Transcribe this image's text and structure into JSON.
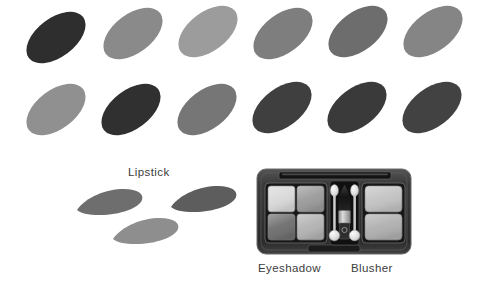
{
  "figure": {
    "background_color": "#ffffff",
    "width": 488,
    "height": 299
  },
  "captions": {
    "lipstick": "Lipstick",
    "eyeshadow": "Eyeshadow",
    "blusher": "Blusher",
    "text_color": "#3c3c3c"
  },
  "oval_swatches": {
    "count": 12,
    "rows": 2,
    "columns": 6,
    "rotation_deg": -37,
    "items": [
      {
        "id": "oval-r1c1",
        "row": 1,
        "col": 1,
        "left": 22,
        "top": 18,
        "color": "#2e2e2e",
        "tone": "very-dark"
      },
      {
        "id": "oval-r1c2",
        "row": 1,
        "col": 2,
        "left": 99,
        "top": 14,
        "color": "#8a8a8a",
        "tone": "medium"
      },
      {
        "id": "oval-r1c3",
        "row": 1,
        "col": 3,
        "left": 174,
        "top": 12,
        "color": "#9c9c9c",
        "tone": "light"
      },
      {
        "id": "oval-r1c4",
        "row": 1,
        "col": 4,
        "left": 249,
        "top": 14,
        "color": "#7e7e7e",
        "tone": "medium"
      },
      {
        "id": "oval-r1c5",
        "row": 1,
        "col": 5,
        "left": 324,
        "top": 12,
        "color": "#6d6d6d",
        "tone": "medium-dark"
      },
      {
        "id": "oval-r1c6",
        "row": 1,
        "col": 6,
        "left": 399,
        "top": 12,
        "color": "#858585",
        "tone": "medium"
      },
      {
        "id": "oval-r2c1",
        "row": 2,
        "col": 1,
        "left": 22,
        "top": 90,
        "color": "#909090",
        "tone": "light"
      },
      {
        "id": "oval-r2c2",
        "row": 2,
        "col": 2,
        "left": 97,
        "top": 90,
        "color": "#303030",
        "tone": "very-dark"
      },
      {
        "id": "oval-r2c3",
        "row": 2,
        "col": 3,
        "left": 173,
        "top": 90,
        "color": "#767676",
        "tone": "medium"
      },
      {
        "id": "oval-r2c4",
        "row": 2,
        "col": 4,
        "left": 248,
        "top": 88,
        "color": "#3f3f3f",
        "tone": "dark"
      },
      {
        "id": "oval-r2c5",
        "row": 2,
        "col": 5,
        "left": 323,
        "top": 88,
        "color": "#3a3a3a",
        "tone": "dark"
      },
      {
        "id": "oval-r2c6",
        "row": 2,
        "col": 6,
        "left": 398,
        "top": 88,
        "color": "#424242",
        "tone": "dark"
      }
    ]
  },
  "lipstick_swatches": {
    "count": 3,
    "items": [
      {
        "id": "lip-1",
        "left": 16,
        "top": 25,
        "color": "#6e6e6e",
        "tone": "medium-dark"
      },
      {
        "id": "lip-2",
        "left": 110,
        "top": 22,
        "color": "#5d5d5d",
        "tone": "dark"
      },
      {
        "id": "lip-3",
        "left": 52,
        "top": 54,
        "color": "#8e8e8e",
        "tone": "light"
      }
    ]
  },
  "palette": {
    "name": "makeup-compact",
    "case_color": "#2a2a2a",
    "case_edge_color": "#4a4a4a",
    "case_highlight_color": "#5c5c5c",
    "hinge_color": "#1b1b1b",
    "eyeshadow_pans": [
      {
        "id": "eyeshadow-pan-1",
        "position": "top-left",
        "color": "#d9d9d9",
        "tone": "very-light"
      },
      {
        "id": "eyeshadow-pan-2",
        "position": "top-right",
        "color": "#9b9b9b",
        "tone": "medium"
      },
      {
        "id": "eyeshadow-pan-3",
        "position": "bottom-left",
        "color": "#6f6f6f",
        "tone": "dark"
      },
      {
        "id": "eyeshadow-pan-4",
        "position": "bottom-right",
        "color": "#b3b3b3",
        "tone": "light"
      }
    ],
    "blusher_pans": [
      {
        "id": "blusher-pan-1",
        "position": "top",
        "color": "#c3c3c3",
        "tone": "light"
      },
      {
        "id": "blusher-pan-2",
        "position": "bottom",
        "color": "#b0b0b0",
        "tone": "light"
      }
    ],
    "applicators": [
      {
        "id": "applicator-left",
        "type": "sponge-tip",
        "tip_color": "#e8e8e8",
        "handle_color": "#cfcfcf"
      },
      {
        "id": "applicator-right",
        "type": "sponge-tip",
        "tip_color": "#e8e8e8",
        "handle_color": "#cfcfcf"
      }
    ],
    "brush": {
      "id": "blusher-brush",
      "bristle_color": "#1e1e1e",
      "ferrule_color": "#b8b8b8",
      "handle_color": "#2b2b2b"
    }
  }
}
